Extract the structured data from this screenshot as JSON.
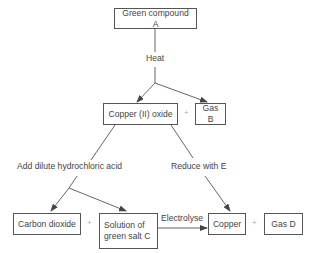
{
  "diagram": {
    "type": "flowchart",
    "nodes": {
      "compound_a": "Green compound A",
      "copper_oxide": "Copper (II) oxide",
      "gas_b": "Gas B",
      "carbon_dioxide": "Carbon dioxide",
      "salt_c_line1": "Solution of",
      "salt_c_line2": "green salt C",
      "copper": "Copper",
      "gas_d": "Gas D"
    },
    "edge_labels": {
      "heat": "Heat",
      "add_acid": "Add dilute hydrochloric acid",
      "reduce": "Reduce with E",
      "electrolyse": "Electrolyse"
    },
    "operators": {
      "plus": "+"
    },
    "edges": [
      {
        "from": "Green compound A",
        "to": "Copper (II) oxide",
        "label": "Heat"
      },
      {
        "from": "Green compound A",
        "to": "Gas B",
        "label": "Heat"
      },
      {
        "from": "Copper (II) oxide",
        "to": "Carbon dioxide",
        "label": "Add dilute hydrochloric acid"
      },
      {
        "from": "Copper (II) oxide",
        "to": "Solution of green salt C",
        "label": "Add dilute hydrochloric acid"
      },
      {
        "from": "Copper (II) oxide",
        "to": "Copper",
        "label": "Reduce with E"
      },
      {
        "from": "Solution of green salt C",
        "to": "Copper",
        "label": "Electrolyse"
      }
    ]
  }
}
